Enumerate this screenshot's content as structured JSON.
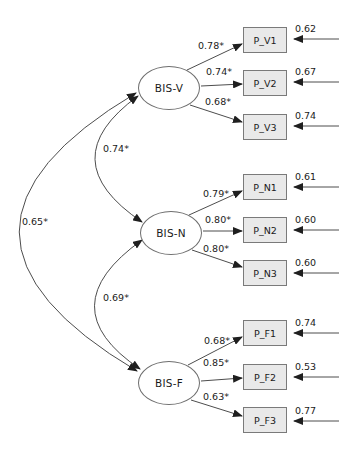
{
  "diagram": {
    "kind": "sem-path-diagram",
    "latents": [
      {
        "label": "BIS-V"
      },
      {
        "label": "BIS-N"
      },
      {
        "label": "BIS-F"
      }
    ],
    "indicators": [
      {
        "label": "P_V1",
        "factor": "BIS-V",
        "loading": "0.78*",
        "error": "0.62"
      },
      {
        "label": "P_V2",
        "factor": "BIS-V",
        "loading": "0.74*",
        "error": "0.67"
      },
      {
        "label": "P_V3",
        "factor": "BIS-V",
        "loading": "0.68*",
        "error": "0.74"
      },
      {
        "label": "P_N1",
        "factor": "BIS-N",
        "loading": "0.79*",
        "error": "0.61"
      },
      {
        "label": "P_N2",
        "factor": "BIS-N",
        "loading": "0.80*",
        "error": "0.60"
      },
      {
        "label": "P_N3",
        "factor": "BIS-N",
        "loading": "0.80*",
        "error": "0.60"
      },
      {
        "label": "P_F1",
        "factor": "BIS-F",
        "loading": "0.68*",
        "error": "0.74"
      },
      {
        "label": "P_F2",
        "factor": "BIS-F",
        "loading": "0.85*",
        "error": "0.53"
      },
      {
        "label": "P_F3",
        "factor": "BIS-F",
        "loading": "0.63*",
        "error": "0.77"
      }
    ],
    "correlations": [
      {
        "between": "BIS-V and BIS-N",
        "value": "0.74*"
      },
      {
        "between": "BIS-V and BIS-F",
        "value": "0.65*"
      },
      {
        "between": "BIS-N and BIS-F",
        "value": "0.69*"
      }
    ],
    "colors": {
      "background": "#ffffff",
      "box_fill": "#e9e9e9",
      "box_border": "#7a7a7a",
      "line": "#4d4d4d",
      "arrowhead": "#1f1f1f",
      "text": "#1a1a1a"
    }
  }
}
